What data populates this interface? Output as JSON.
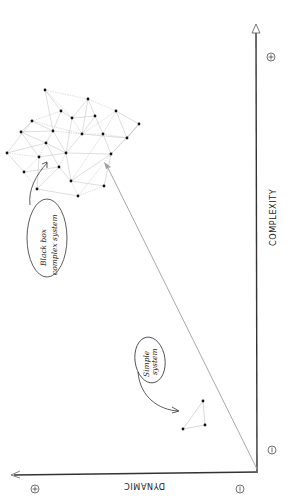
{
  "diagram": {
    "orientation": "rotated 90 degrees clockwise",
    "axes": {
      "x_axis": {
        "label": "COMPLEXITY",
        "min_marker": "⊖",
        "max_marker": "⊕"
      },
      "y_axis": {
        "label": "DYNAMIC",
        "min_marker": "⊖",
        "max_marker": "⊕"
      }
    },
    "annotations": {
      "simple": {
        "line1": "Simple",
        "line2": "system"
      },
      "complex": {
        "line1": "Black box",
        "line2": "complex system"
      }
    },
    "colors": {
      "axis": "#333333",
      "edge": "#bdbdbd",
      "node": "#111111",
      "diagonal": "#9e9e9e"
    },
    "simple_nodes": [
      [
        183,
        429
      ],
      [
        203,
        401
      ],
      [
        205,
        425
      ]
    ],
    "complex_nodes": [
      [
        45,
        90
      ],
      [
        88,
        99
      ],
      [
        61,
        111
      ],
      [
        72,
        118
      ],
      [
        95,
        116
      ],
      [
        116,
        111
      ],
      [
        32,
        121
      ],
      [
        21,
        132
      ],
      [
        53,
        131
      ],
      [
        82,
        134
      ],
      [
        103,
        134
      ],
      [
        127,
        138
      ],
      [
        139,
        124
      ],
      [
        46,
        143
      ],
      [
        7,
        153
      ],
      [
        39,
        157
      ],
      [
        66,
        153
      ],
      [
        111,
        154
      ],
      [
        24,
        172
      ],
      [
        59,
        167
      ],
      [
        71,
        181
      ],
      [
        37,
        189
      ],
      [
        78,
        196
      ],
      [
        104,
        186
      ]
    ],
    "complex_edges": [
      [
        0,
        1
      ],
      [
        0,
        2
      ],
      [
        0,
        8
      ],
      [
        0,
        3
      ],
      [
        1,
        3
      ],
      [
        1,
        4
      ],
      [
        1,
        5
      ],
      [
        1,
        9
      ],
      [
        2,
        3
      ],
      [
        2,
        6
      ],
      [
        2,
        8
      ],
      [
        3,
        4
      ],
      [
        3,
        9
      ],
      [
        4,
        9
      ],
      [
        4,
        10
      ],
      [
        5,
        9
      ],
      [
        5,
        11
      ],
      [
        5,
        12
      ],
      [
        5,
        10
      ],
      [
        6,
        7
      ],
      [
        6,
        8
      ],
      [
        6,
        9
      ],
      [
        7,
        13
      ],
      [
        7,
        8
      ],
      [
        8,
        9
      ],
      [
        8,
        13
      ],
      [
        8,
        16
      ],
      [
        9,
        10
      ],
      [
        9,
        11
      ],
      [
        9,
        16
      ],
      [
        10,
        11
      ],
      [
        10,
        17
      ],
      [
        11,
        12
      ],
      [
        11,
        17
      ],
      [
        12,
        17
      ],
      [
        13,
        14
      ],
      [
        13,
        15
      ],
      [
        13,
        16
      ],
      [
        13,
        19
      ],
      [
        14,
        15
      ],
      [
        14,
        18
      ],
      [
        15,
        16
      ],
      [
        15,
        18
      ],
      [
        15,
        21
      ],
      [
        16,
        17
      ],
      [
        16,
        19
      ],
      [
        16,
        20
      ],
      [
        17,
        20
      ],
      [
        17,
        22
      ],
      [
        17,
        23
      ],
      [
        18,
        19
      ],
      [
        18,
        21
      ],
      [
        19,
        20
      ],
      [
        19,
        21
      ],
      [
        20,
        22
      ],
      [
        20,
        23
      ],
      [
        21,
        22
      ],
      [
        22,
        23
      ],
      [
        14,
        6
      ],
      [
        3,
        16
      ],
      [
        10,
        20
      ],
      [
        12,
        11
      ],
      [
        7,
        15
      ]
    ]
  }
}
